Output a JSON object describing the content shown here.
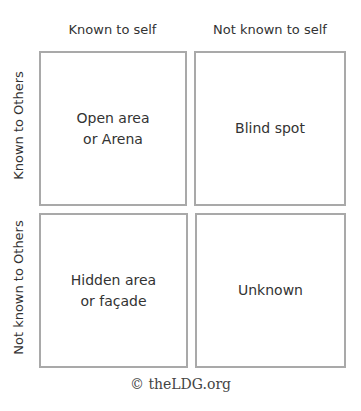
{
  "diagram": {
    "column_headers": [
      "Known to self",
      "Not known to self"
    ],
    "row_headers": [
      "Known to Others",
      "Not known to Others"
    ],
    "cells": [
      {
        "line1": "Open area",
        "line2": "or Arena"
      },
      {
        "line1": "Blind spot",
        "line2": ""
      },
      {
        "line1": "Hidden area",
        "line2": "or façade"
      },
      {
        "line1": "Unknown",
        "line2": ""
      }
    ],
    "colors": {
      "border": "#a9a9a9",
      "text": "#333333"
    }
  },
  "footer": {
    "copyright": "© theLDG.org"
  }
}
